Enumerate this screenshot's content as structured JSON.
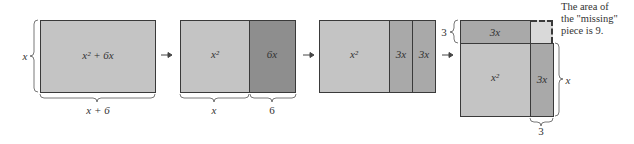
{
  "panels": [
    {
      "id": "panel-1",
      "regions": [
        {
          "label": "x² + 6x",
          "shade": "light"
        }
      ],
      "side_label": "x",
      "bottom_labels": [
        "x + 6"
      ]
    },
    {
      "id": "panel-2",
      "regions": [
        {
          "label": "x²",
          "shade": "light"
        },
        {
          "label": "6x",
          "shade": "dark"
        }
      ],
      "bottom_labels": [
        "x",
        "6"
      ]
    },
    {
      "id": "panel-3",
      "regions": [
        {
          "label": "x²",
          "shade": "light"
        },
        {
          "label": "3x",
          "shade": "mid"
        },
        {
          "label": "3x",
          "shade": "mid"
        }
      ]
    },
    {
      "id": "panel-4",
      "regions": [
        {
          "label": "3x",
          "shade": "mid"
        },
        {
          "label": "x²",
          "shade": "light"
        },
        {
          "label": "3x",
          "shade": "mid"
        },
        {
          "label": "",
          "shade": "missing"
        }
      ],
      "left_label": "3",
      "right_label": "x",
      "bottom_label": "3",
      "note": [
        "The area of",
        "the \"missing\"",
        "piece is 9."
      ]
    }
  ],
  "text": {
    "p1_region": "x² + 6x",
    "p1_side": "x",
    "p1_bottom": "x + 6",
    "p2_left": "x²",
    "p2_right": "6x",
    "p2_bottom_left": "x",
    "p2_bottom_right": "6",
    "p3_left": "x²",
    "p3_mid": "3x",
    "p3_right": "3x",
    "p4_top": "3x",
    "p4_main": "x²",
    "p4_right": "3x",
    "p4_left_label": "3",
    "p4_right_label": "x",
    "p4_bottom_label": "3",
    "note_line1": "The area of",
    "note_line2": "the \"missing\"",
    "note_line3": "piece is 9."
  },
  "colors": {
    "light": "#c4c4c4",
    "mid": "#a9a9a9",
    "dark": "#8e8e8e",
    "missing": "#d9d9d9",
    "border": "#3a3a3a"
  }
}
